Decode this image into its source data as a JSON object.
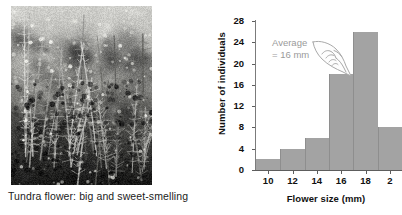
{
  "figure": {
    "photo": {
      "alt_name": "tundra-flower-photograph",
      "caption": "Tundra flower: big and sweet-smelling"
    }
  },
  "chart_data": {
    "type": "bar",
    "title": "",
    "xlabel": "Flower size (mm)",
    "ylabel": "Number of individuals",
    "bin_width": 2,
    "bin_starts": [
      9,
      11,
      13,
      15,
      17,
      19
    ],
    "categories": [
      "9-11",
      "11-13",
      "13-15",
      "15-17",
      "17-19",
      "19-21"
    ],
    "values": [
      2,
      4,
      6,
      18,
      26,
      8
    ],
    "xlim": [
      9,
      21
    ],
    "ylim": [
      0,
      28
    ],
    "xticks": [
      10,
      12,
      14,
      16,
      18,
      20
    ],
    "xtick_labels": [
      "10",
      "12",
      "14",
      "16",
      "18",
      "2"
    ],
    "yticks": [
      0,
      4,
      8,
      12,
      16,
      20,
      24,
      28
    ],
    "ytick_labels": [
      "0",
      "4",
      "8",
      "12",
      "16",
      "20",
      "24",
      "28"
    ],
    "grid": false,
    "legend": false,
    "bar_color": "#a3a3a3",
    "annotations": [
      {
        "name": "average-callout",
        "line1": "Average",
        "line2": "= 16 mm",
        "value": 16,
        "unit": "mm",
        "color": "#9a9a9a"
      }
    ]
  }
}
